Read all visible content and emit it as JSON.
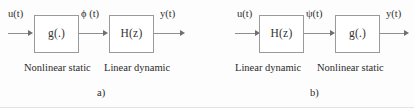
{
  "figure": {
    "width": 414,
    "height": 108,
    "background_color": "#fdfdfd",
    "line_color": "#8e8e8e",
    "text_color": "#2b2b2b"
  },
  "diagrams": [
    {
      "id": "a",
      "subfigure_label": "a)",
      "input_signal": "u(t)",
      "intermediate_signal": "ϕ (t)",
      "output_signal": "y(t)",
      "blocks": [
        {
          "label": "g(.)",
          "caption": "Nonlinear static"
        },
        {
          "label": "H(z)",
          "caption": "Linear dynamic"
        }
      ]
    },
    {
      "id": "b",
      "subfigure_label": "b)",
      "input_signal": "u(t)",
      "intermediate_signal": "ψ(t)",
      "output_signal": "y(t)",
      "blocks": [
        {
          "label": "H(z)",
          "caption": "Linear dynamic"
        },
        {
          "label": "g(.)",
          "caption": "Nonlinear static"
        }
      ]
    }
  ]
}
